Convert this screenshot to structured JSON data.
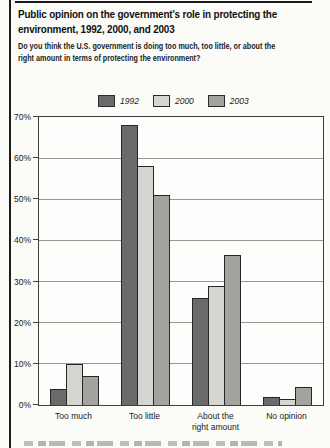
{
  "page": {
    "title": "Public opinion on the government's role in protecting the environment, 1992, 2000, and 2003",
    "title_lines": [
      "Public opinion on the government's role in protecting the",
      "environment, 1992, 2000, and 2003"
    ],
    "subtitle": "Do you think the U.S. government is doing too much, too little, or about the right amount in terms of protecting the environment?",
    "subtitle_lines": [
      "Do you think the U.S. government is doing too much, too little, or about the",
      "right amount in terms of protecting the environment?"
    ]
  },
  "colors": {
    "series_1992": "#6a6a6a",
    "series_2000": "#d5d5d1",
    "series_2003": "#a3a3a0",
    "bar_border": "#262626",
    "gridline": "#989894",
    "frame": "#3f3f3f",
    "rule": "#1c1c1c",
    "background": "#fbfbf8"
  },
  "legend": {
    "items": [
      {
        "label": "1992",
        "color": "#6a6a6a"
      },
      {
        "label": "2000",
        "color": "#d5d5d1"
      },
      {
        "label": "2003",
        "color": "#a3a3a0"
      }
    ]
  },
  "chart_data": {
    "type": "bar",
    "title": "Public opinion on the government's role in protecting the environment, 1992, 2000, and 2003",
    "subtitle": "Do you think the U.S. government is doing too much, too little, or about the right amount in terms of protecting the environment?",
    "categories": [
      "Too much",
      "Too little",
      "About the right amount",
      "No opinion"
    ],
    "categories_display": [
      [
        "Too much"
      ],
      [
        "Too little"
      ],
      [
        "About the",
        "right amount"
      ],
      [
        "No opinion"
      ]
    ],
    "series": [
      {
        "name": "1992",
        "color": "#6a6a6a",
        "values": [
          4,
          68,
          26,
          2
        ]
      },
      {
        "name": "2000",
        "color": "#d5d5d1",
        "values": [
          10,
          58,
          29,
          1.5
        ]
      },
      {
        "name": "2003",
        "color": "#a3a3a0",
        "values": [
          7,
          51,
          36.5,
          4.5
        ]
      }
    ],
    "xlabel": "",
    "ylabel": "",
    "ylim": [
      0,
      70
    ],
    "y_ticks": [
      "70%",
      "60%",
      "50%",
      "40%",
      "30%",
      "20%",
      "10%",
      "0%"
    ],
    "grid": true,
    "legend_position": "top"
  }
}
